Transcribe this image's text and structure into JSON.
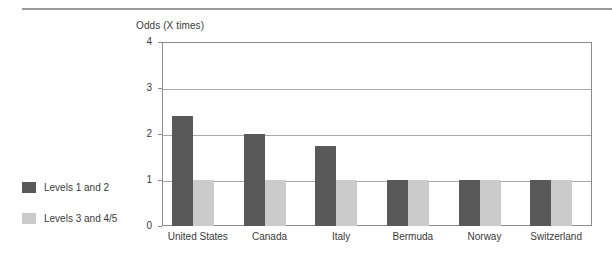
{
  "chart_data": {
    "type": "bar",
    "title": "",
    "subtitle": "",
    "xlabel": "",
    "ylabel": "Odds (X times)",
    "ylim": [
      0,
      4
    ],
    "yticks": [
      "0",
      "1",
      "2",
      "3",
      "4"
    ],
    "grid": true,
    "legend_position": "left-outside",
    "categories": [
      "United States",
      "Canada",
      "Italy",
      "Bermuda",
      "Norway",
      "Switzerland"
    ],
    "series": [
      {
        "name": "Levels 1 and 2",
        "color": "#595959",
        "values": [
          2.4,
          2.0,
          1.75,
          1.0,
          1.0,
          1.0
        ]
      },
      {
        "name": "Levels 3 and 4/5",
        "color": "#cbcbcb",
        "values": [
          1.0,
          1.0,
          1.0,
          1.0,
          1.0,
          1.0
        ]
      }
    ]
  },
  "figure": {
    "axis_title": "Odds (X times)",
    "top_rule_present": true
  }
}
